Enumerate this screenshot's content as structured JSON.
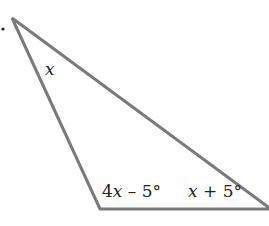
{
  "figure": {
    "type": "triangle",
    "bullet": ".",
    "stroke_color": "#7a7a7a",
    "vertices": {
      "top": [
        12,
        18
      ],
      "bottom_left": [
        100,
        209
      ],
      "bottom_right": [
        269,
        209
      ]
    },
    "angle_labels": {
      "top": {
        "var": "x",
        "rest": ""
      },
      "bottom_left": {
        "var": "4",
        "var2": "x",
        "rest": " – 5°"
      },
      "bottom_right": {
        "var": "x",
        "rest": " + 5°"
      }
    }
  }
}
